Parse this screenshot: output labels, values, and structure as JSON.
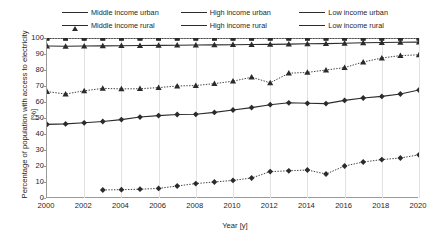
{
  "chart_data": {
    "type": "line",
    "title": "",
    "xlabel": "Year [y]",
    "ylabel": "Percentage of population with access to electricity [%]",
    "xlim": [
      2000,
      2020
    ],
    "ylim": [
      0,
      100
    ],
    "ytick_labels": [
      "100",
      "90",
      "80",
      "70",
      "60",
      "50",
      "40",
      "30",
      "20",
      "10",
      "0"
    ],
    "ytick_values": [
      100,
      90,
      80,
      70,
      60,
      50,
      40,
      30,
      20,
      10,
      0
    ],
    "xtick_labels": [
      "2000",
      "2002",
      "2004",
      "2006",
      "2008",
      "2010",
      "2012",
      "2014",
      "2016",
      "2018",
      "2020"
    ],
    "xtick_values": [
      2000,
      2002,
      2004,
      2006,
      2008,
      2010,
      2012,
      2014,
      2016,
      2018,
      2020
    ],
    "grid": "vertical",
    "legend_position": "top",
    "x": [
      2000,
      2001,
      2002,
      2003,
      2004,
      2005,
      2006,
      2007,
      2008,
      2009,
      2010,
      2011,
      2012,
      2013,
      2014,
      2015,
      2016,
      2017,
      2018,
      2019,
      2020
    ],
    "series": [
      {
        "name": "Middle income urban",
        "style": "solid",
        "marker": "triangle",
        "color": "#2b2b2b",
        "values": [
          95.0,
          94.8,
          95.0,
          95.1,
          95.2,
          95.3,
          95.4,
          95.5,
          95.6,
          95.7,
          95.8,
          95.9,
          96.0,
          96.2,
          96.4,
          96.5,
          96.7,
          97.0,
          97.2,
          97.3,
          97.4
        ]
      },
      {
        "name": "High income urban",
        "style": "solid",
        "marker": "square",
        "color": "#2b2b2b",
        "values": [
          100,
          100,
          100,
          100,
          100,
          100,
          100,
          100,
          100,
          100,
          100,
          100,
          100,
          100,
          100,
          100,
          100,
          100,
          100,
          100,
          100
        ]
      },
      {
        "name": "Low income urban",
        "style": "solid",
        "marker": "diamond",
        "color": "#2b2b2b",
        "values": [
          46.0,
          46.3,
          47.0,
          47.8,
          49.0,
          50.6,
          51.5,
          52.2,
          52.3,
          53.5,
          55.0,
          56.5,
          58.3,
          59.5,
          59.2,
          59.0,
          61.0,
          62.5,
          63.5,
          65.0,
          67.5
        ]
      },
      {
        "name": "Middle income rural",
        "style": "dotted",
        "marker": "triangle",
        "color": "#2b2b2b",
        "values": [
          66.5,
          65.0,
          67.0,
          68.5,
          68.2,
          68.3,
          69.0,
          70.0,
          70.3,
          71.5,
          73.0,
          75.5,
          72.0,
          78.0,
          78.5,
          80.0,
          81.5,
          85.0,
          87.5,
          89.0,
          89.5
        ]
      },
      {
        "name": "High income rural",
        "style": "dotted",
        "marker": "square",
        "color": "#2b2b2b",
        "values": [
          99.8,
          99.8,
          99.8,
          99.8,
          99.8,
          99.8,
          99.8,
          99.8,
          99.8,
          99.8,
          99.8,
          99.8,
          99.8,
          99.8,
          99.8,
          99.8,
          99.8,
          99.8,
          99.8,
          99.8,
          99.8
        ]
      },
      {
        "name": "Low income rural",
        "style": "dotted",
        "marker": "diamond",
        "color": "#2b2b2b",
        "values": [
          null,
          null,
          null,
          5.0,
          5.2,
          5.5,
          6.0,
          7.5,
          9.0,
          10.0,
          11.0,
          12.5,
          16.5,
          17.0,
          17.5,
          15.0,
          20.0,
          22.5,
          24.0,
          25.0,
          27.0
        ]
      }
    ]
  },
  "legend": {
    "items": [
      {
        "label": "Middle income urban",
        "marker": "triangle",
        "style": "solid"
      },
      {
        "label": "High income urban",
        "marker": "square",
        "style": "solid"
      },
      {
        "label": "Low income urban",
        "marker": "diamond",
        "style": "solid"
      },
      {
        "label": "Middle income rural",
        "marker": "triangle",
        "style": "dotted"
      },
      {
        "label": "High income rural",
        "marker": "square",
        "style": "dotted"
      },
      {
        "label": "Low income rural",
        "marker": "diamond",
        "style": "dotted"
      }
    ]
  },
  "axis": {
    "y_title": "Percentage of population with access to electricity [%]",
    "x_title": "Year [y]"
  }
}
